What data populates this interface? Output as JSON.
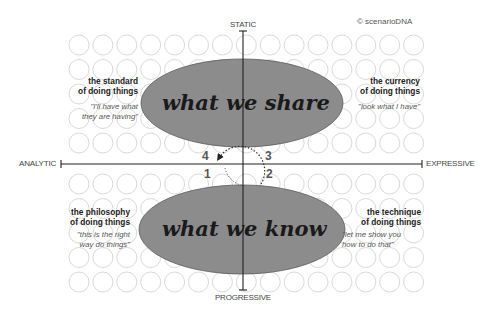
{
  "copyright": "© scenarioDNA",
  "axes": {
    "top": "STATIC",
    "bottom": "PROGRESSIVE",
    "left": "ANALYTIC",
    "right": "EXPRESSIVE"
  },
  "ellipses": {
    "top": {
      "label": "what we share",
      "fill": "#8c8c8c"
    },
    "bottom": {
      "label": "what we know",
      "fill": "#8c8c8c"
    }
  },
  "quadrants": {
    "top_left": {
      "title_line1": "the standard",
      "title_line2": "of doing things",
      "quote_line1": "\"I'll have what",
      "quote_line2": "they are having\""
    },
    "top_right": {
      "title_line1": "the currency",
      "title_line2": "of doing things",
      "quote_line1": "\"look what I have\""
    },
    "bottom_left": {
      "title_line1": "the philosophy",
      "title_line2": "of doing things",
      "quote_line1": "\"this is the right",
      "quote_line2": "way do things\""
    },
    "bottom_right": {
      "title_line1": "the technique",
      "title_line2": "of doing things",
      "quote_line1": "\"let me show you",
      "quote_line2": "how to do that\""
    }
  },
  "cycle_steps": {
    "one": "1",
    "two": "2",
    "three": "3",
    "four": "4"
  },
  "colors": {
    "axis": "#222222",
    "grid_circle": "#d9d9d9",
    "ellipse_stroke": "#5a5a5a",
    "ellipse_fill": "#8c8c8c"
  },
  "grid": {
    "columns": 15,
    "rows_top": 5,
    "rows_bottom": 5
  }
}
